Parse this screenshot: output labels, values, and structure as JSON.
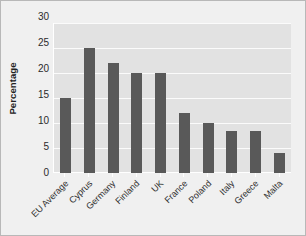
{
  "chart_data": {
    "type": "bar",
    "title": "",
    "xlabel": "",
    "ylabel": "Percentage",
    "categories": [
      "EU Average",
      "Cyprus",
      "Germany",
      "Finland",
      "UK",
      "France",
      "Poland",
      "Italy",
      "Greece",
      "Malta"
    ],
    "values": [
      15,
      25,
      22,
      20,
      20,
      12,
      10,
      8.5,
      8.5,
      4
    ],
    "ylim": [
      0,
      30
    ],
    "ytick_labels": [
      "30",
      "25",
      "20",
      "15",
      "10",
      "5",
      "0"
    ],
    "yticks": [
      30,
      25,
      20,
      15,
      10,
      5,
      0
    ],
    "grid": true,
    "legend": "none",
    "colors": {
      "bar": "#595959",
      "plot_background": "#e2e2e2",
      "figure_background": "#f0f0f0",
      "gridline": "#fbfbfb",
      "border": "#b8b8b8",
      "text": "#2b2b2b"
    }
  }
}
